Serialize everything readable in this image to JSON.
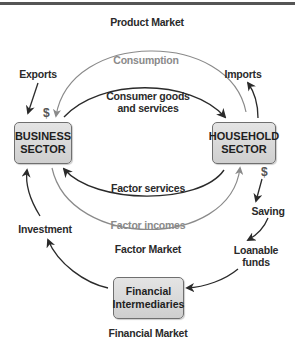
{
  "diagram": {
    "nodes": {
      "business": "BUSINESS\nSECTOR",
      "household": "HOUSEHOLD\nSECTOR",
      "financial": "Financial\nIntermediaries"
    },
    "markets": {
      "product": "Product Market",
      "factor": "Factor Market",
      "financial": "Financial Market"
    },
    "flows": {
      "consumption": "Consumption",
      "consumer_goods": "Consumer goods\nand services",
      "factor_services": "Factor services",
      "factor_incomes": "Factor incomes",
      "exports": "Exports",
      "imports": "Imports",
      "saving": "Saving",
      "loanable_funds": "Loanable\nfunds",
      "investment": "Investment"
    },
    "money_symbol": "$",
    "colors": {
      "money_flow": "#8a8a8a",
      "real_flow": "#2a2a2a",
      "box_fill": "#d9d9d9",
      "box_border": "#6f6f6f"
    }
  }
}
